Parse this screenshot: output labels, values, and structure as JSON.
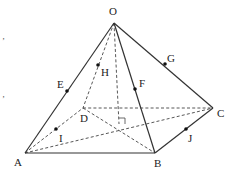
{
  "figure": {
    "colors": {
      "line": "#333333",
      "point": "#111111",
      "label": "#222222"
    },
    "vertices": {
      "O": {
        "x": 114,
        "y": 23,
        "label": "O",
        "lx": 109,
        "ly": 15
      },
      "A": {
        "x": 25,
        "y": 153,
        "label": "A",
        "lx": 14,
        "ly": 166
      },
      "B": {
        "x": 155,
        "y": 153,
        "label": "B",
        "lx": 154,
        "ly": 167
      },
      "C": {
        "x": 213,
        "y": 108,
        "label": "C",
        "lx": 217,
        "ly": 117
      },
      "D": {
        "x": 83,
        "y": 108,
        "label": "D",
        "lx": 80,
        "ly": 122
      },
      "foot": {
        "x": 119,
        "y": 124
      }
    },
    "points": [
      {
        "name": "E",
        "x": 67,
        "y": 91,
        "label": "E",
        "lx": 57,
        "ly": 88
      },
      {
        "name": "F",
        "x": 135,
        "y": 89,
        "label": "F",
        "lx": 139,
        "ly": 87
      },
      {
        "name": "G",
        "x": 165,
        "y": 64,
        "label": "G",
        "lx": 167,
        "ly": 62
      },
      {
        "name": "H",
        "x": 98,
        "y": 65,
        "label": "H",
        "lx": 101,
        "ly": 76
      },
      {
        "name": "I",
        "x": 56,
        "y": 129,
        "label": "I",
        "lx": 59,
        "ly": 142
      },
      {
        "name": "J",
        "x": 186,
        "y": 129,
        "label": "J",
        "lx": 188,
        "ly": 142
      }
    ],
    "solid_edges": [
      [
        "O",
        "A"
      ],
      [
        "O",
        "B"
      ],
      [
        "O",
        "C"
      ],
      [
        "A",
        "B"
      ],
      [
        "B",
        "C"
      ]
    ],
    "dashed_edges": [
      [
        "O",
        "D"
      ],
      [
        "A",
        "D"
      ],
      [
        "D",
        "C"
      ],
      [
        "A",
        "C"
      ],
      [
        "D",
        "B"
      ],
      [
        "O",
        "foot"
      ]
    ],
    "margin_marks": [
      {
        "text": "ʼ",
        "x": 2,
        "y": 44
      },
      {
        "text": "ʼ",
        "x": 2,
        "y": 102
      }
    ]
  }
}
